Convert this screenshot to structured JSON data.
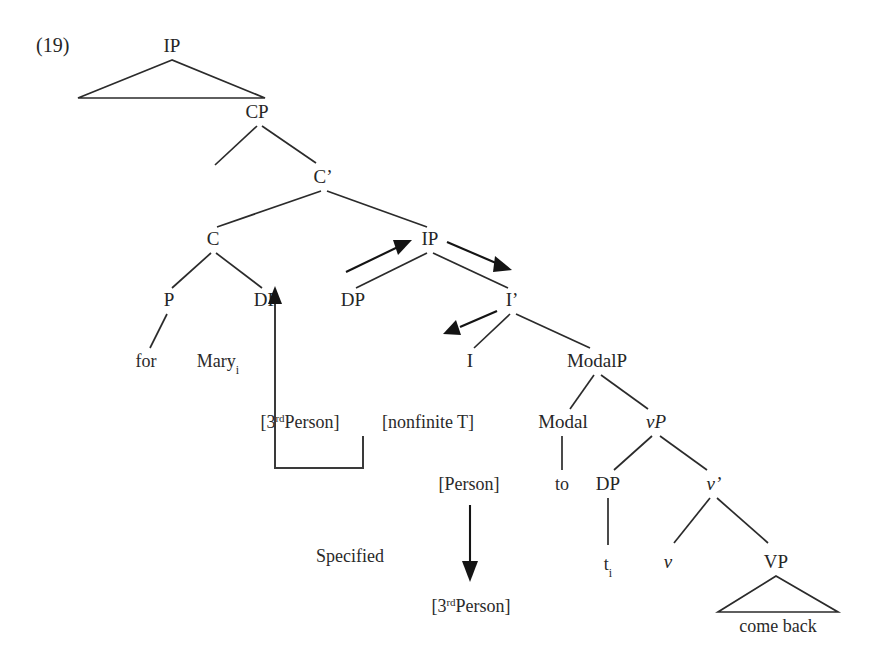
{
  "figure": {
    "number": "(19)",
    "caption_note": "Syntax tree for 'John longed for Mary to come back'"
  },
  "nodes": {
    "ip_top": "IP",
    "john_longed": "John longed",
    "cp": "CP",
    "c_bar": "C’",
    "c": "C",
    "ip_embedded": "IP",
    "p": "P",
    "dp_spec_cp": "DP",
    "dp_spec_ip": "DP",
    "i_bar": "I’",
    "i": "I",
    "modalp": "ModalP",
    "modal": "Modal",
    "vp_little": "vP",
    "dp_subject": "DP",
    "v_bar": "v’",
    "v_little": "v",
    "vp_big": "VP"
  },
  "terminals": {
    "for": "for",
    "mary": "Mary",
    "mary_index": "i",
    "to": "to",
    "trace": "t",
    "trace_index": "i",
    "come_back": "come back"
  },
  "features": {
    "third_person_source": {
      "open": "[3",
      "ordinal": "rd",
      "rest": "Person]"
    },
    "nonfinite_t": "[nonfinite T]",
    "person": "[Person]",
    "third_person_result": {
      "open": "[3",
      "ordinal": "rd",
      "rest": "Person]"
    }
  },
  "annotations": {
    "specified": "Specified"
  },
  "colors": {
    "ink": "#262626",
    "line": "#2b2b2b",
    "arrow": "#141414",
    "background": "#ffffff"
  },
  "icons": {
    "agree_arrow": "arrow-up-left",
    "movement_arrow_ip": "arrow-up-right",
    "movement_arrow_i": "arrow-down-left",
    "movement_arrow_ibar": "arrow-down-right",
    "valuation_arrow": "arrow-down"
  }
}
